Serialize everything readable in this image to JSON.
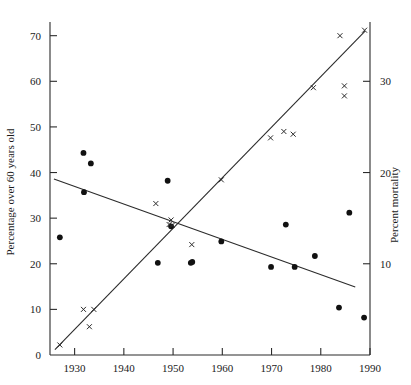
{
  "chart_data": {
    "type": "scatter",
    "title": "",
    "xlabel": "",
    "ylabel_left": "Percentage over 60 years old",
    "ylabel_right": "Percent mortality",
    "xlim": [
      1925,
      1990
    ],
    "x_ticks": [
      1930,
      1940,
      1950,
      1960,
      1970,
      1980,
      1990
    ],
    "left_ylim": [
      0,
      73
    ],
    "left_y_ticks": [
      0,
      10,
      20,
      30,
      40,
      50,
      60,
      70
    ],
    "right_ylim": [
      0,
      36.5
    ],
    "right_y_ticks": [
      10,
      20,
      30
    ],
    "grid": false,
    "legend": "none",
    "series": [
      {
        "name": "Percentage over 60 years old",
        "marker": "filled-circle",
        "axis": "left",
        "points": [
          {
            "x": 1927.0,
            "y": 25.8
          },
          {
            "x": 1931.8,
            "y": 44.3
          },
          {
            "x": 1933.3,
            "y": 42.0
          },
          {
            "x": 1931.9,
            "y": 35.7
          },
          {
            "x": 1946.9,
            "y": 20.2
          },
          {
            "x": 1948.9,
            "y": 38.2
          },
          {
            "x": 1949.6,
            "y": 28.2
          },
          {
            "x": 1953.6,
            "y": 20.2
          },
          {
            "x": 1953.9,
            "y": 20.4
          },
          {
            "x": 1959.8,
            "y": 24.9
          },
          {
            "x": 1969.9,
            "y": 19.3
          },
          {
            "x": 1972.9,
            "y": 28.6
          },
          {
            "x": 1974.7,
            "y": 19.3
          },
          {
            "x": 1978.8,
            "y": 21.7
          },
          {
            "x": 1983.7,
            "y": 10.4
          },
          {
            "x": 1985.8,
            "y": 31.2
          },
          {
            "x": 1988.8,
            "y": 8.2
          }
        ]
      },
      {
        "name": "Percent mortality",
        "marker": "cross",
        "axis": "right",
        "points": [
          {
            "x": 1927.0,
            "y": 1.1
          },
          {
            "x": 1931.8,
            "y": 5.0
          },
          {
            "x": 1933.0,
            "y": 3.1
          },
          {
            "x": 1933.9,
            "y": 5.0
          },
          {
            "x": 1946.5,
            "y": 16.6
          },
          {
            "x": 1949.2,
            "y": 14.3
          },
          {
            "x": 1949.6,
            "y": 14.8
          },
          {
            "x": 1949.8,
            "y": 14.2
          },
          {
            "x": 1953.8,
            "y": 12.1
          },
          {
            "x": 1959.8,
            "y": 19.2
          },
          {
            "x": 1969.8,
            "y": 23.8
          },
          {
            "x": 1972.5,
            "y": 24.5
          },
          {
            "x": 1974.4,
            "y": 24.2
          },
          {
            "x": 1978.5,
            "y": 29.3
          },
          {
            "x": 1983.9,
            "y": 35.0
          },
          {
            "x": 1984.8,
            "y": 29.5
          },
          {
            "x": 1984.8,
            "y": 28.4
          },
          {
            "x": 1988.9,
            "y": 35.6
          }
        ]
      }
    ],
    "trend_lines": [
      {
        "name": "declining-trend-line",
        "axis": "left",
        "x1": 1925.8,
        "y1": 38.6,
        "x2": 1987.0,
        "y2": 14.9
      },
      {
        "name": "rising-trend-line",
        "axis": "right",
        "x1": 1926.0,
        "y1": 0.6,
        "x2": 1989.0,
        "y2": 35.5
      }
    ]
  },
  "axes": {
    "left_tick_labels": [
      "70",
      "60",
      "50",
      "40",
      "30",
      "20",
      "10",
      "0"
    ],
    "bottom_tick_labels": [
      "1930",
      "1940",
      "1950",
      "1960",
      "1970",
      "1980",
      "1990"
    ],
    "right_tick_labels": [
      "30",
      "20",
      "10"
    ],
    "left_title": "Percentage over 60 years old",
    "right_title": "Percent mortality"
  },
  "colors": {
    "axis": "#2b2b2b",
    "marker_dot": "#111111",
    "marker_cross": "#2b2b2b",
    "line": "#2b2b2b",
    "background": "#ffffff"
  }
}
